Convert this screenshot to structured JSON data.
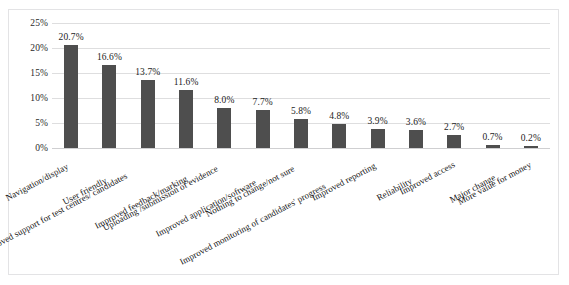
{
  "chart_data": {
    "type": "bar",
    "title": "",
    "subtitle": "",
    "xlabel": "",
    "ylabel": "",
    "ylim": [
      0,
      25
    ],
    "ytick_labels": [
      "0%",
      "5%",
      "10%",
      "15%",
      "20%",
      "25%"
    ],
    "ytick_values": [
      0,
      5,
      10,
      15,
      20,
      25
    ],
    "grid": true,
    "legend": "none",
    "bar_color": "#4e4e4e",
    "gridline_color": "#dededf",
    "categories": [
      "Navigation/display",
      "User friendly",
      "Improved support for test centres/ candidates",
      "Improved feedback/marking",
      "Uploading /submission of evidence",
      "Improved application/software",
      "Nothing to change/not sure",
      "Improved monitoring of candidates' progress",
      "Improved reporting",
      "Reliability",
      "Improved access",
      "Major change",
      "More value for money"
    ],
    "values": [
      20.7,
      16.6,
      13.7,
      11.6,
      8.0,
      7.7,
      5.8,
      4.8,
      3.9,
      3.6,
      2.7,
      0.7,
      0.2
    ],
    "data_labels": [
      "20.7%",
      "16.6%",
      "13.7%",
      "11.6%",
      "8.0%",
      "7.7%",
      "5.8%",
      "4.8%",
      "3.9%",
      "3.6%",
      "2.7%",
      "0.7%",
      "0.2%"
    ]
  }
}
